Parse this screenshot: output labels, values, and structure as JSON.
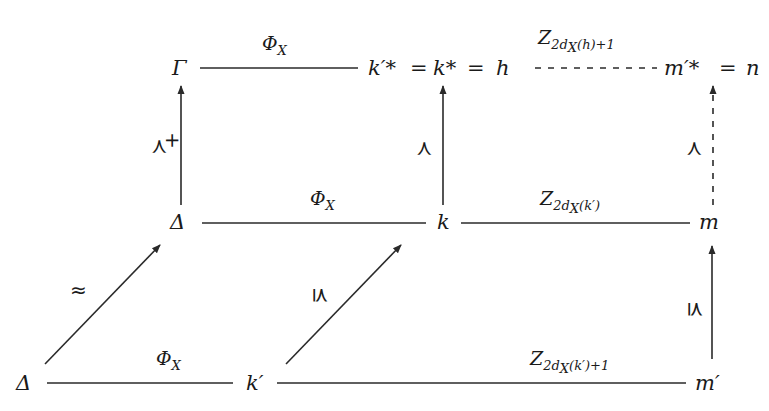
{
  "diagram": {
    "nodes": {
      "gamma": "Γ",
      "top_k_prime_star": "k′*",
      "top_eq1": "=",
      "top_k_star": "k*",
      "top_eq2": "=",
      "top_h": "h",
      "top_m_prime_star": "m′*",
      "top_eq3": "=",
      "top_n": "n",
      "mid_delta": "Δ",
      "mid_k": "k",
      "mid_m": "m",
      "bot_delta": "Δ",
      "bot_k_prime": "k′",
      "bot_m_prime": "m′"
    },
    "edge_labels": {
      "top_phi": "Φ",
      "top_phi_sub": "X",
      "top_z": "Z",
      "top_z_sub": "2d",
      "top_z_subsub": "X",
      "top_z_tail": "(h)+1",
      "mid_phi": "Φ",
      "mid_phi_sub": "X",
      "mid_z": "Z",
      "mid_z_sub": "2d",
      "mid_z_subsub": "X",
      "mid_z_tail": "(k′)",
      "bot_phi": "Φ",
      "bot_phi_sub": "X",
      "bot_z": "Z",
      "bot_z_sub": "2d",
      "bot_z_subsub": "X",
      "bot_z_tail": "(k′)+1",
      "left_vertical": "≺",
      "left_vertical_sup": "+",
      "middle_vertical": "≺",
      "right_vertical_dashed": "≺",
      "right_vertical_lower": "⪯",
      "left_diagonal": "≈",
      "middle_diagonal": "⪯"
    },
    "colors": {
      "ink": "#1a1a1a",
      "background": "#ffffff"
    }
  }
}
